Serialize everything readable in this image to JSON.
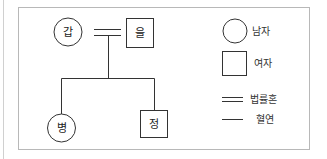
{
  "diagram": {
    "type": "family-tree",
    "nodes": [
      {
        "id": "gap",
        "label": "갑",
        "shape": "circle"
      },
      {
        "id": "eul",
        "label": "을",
        "shape": "square"
      },
      {
        "id": "byeong",
        "label": "병",
        "shape": "circle"
      },
      {
        "id": "jeong",
        "label": "정",
        "shape": "square"
      }
    ],
    "edges": [
      {
        "from": "gap",
        "to": "eul",
        "type": "법률혼"
      },
      {
        "from": "gap-eul",
        "to": "byeong",
        "type": "혈연"
      },
      {
        "from": "gap-eul",
        "to": "jeong",
        "type": "혈연"
      }
    ]
  },
  "legend": {
    "male": "남자",
    "female": "여자",
    "marriage": "법률혼",
    "blood": "혈연"
  },
  "colors": {
    "stroke": "#333333",
    "frame": "#b8b8b8",
    "text": "#222222"
  }
}
